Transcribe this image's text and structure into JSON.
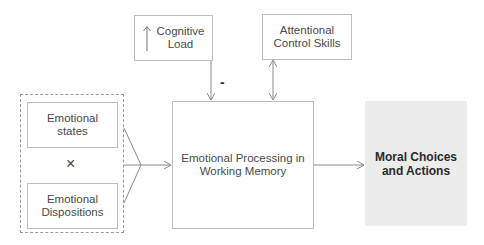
{
  "diagram": {
    "nodes": {
      "cognitive_load": {
        "line1": "Cognitive",
        "line2": "Load",
        "icon": "up-arrow-icon"
      },
      "attentional_control": {
        "line1": "Attentional",
        "line2": "Control Skills"
      },
      "emotional_states": {
        "line1": "Emotional",
        "line2": "states"
      },
      "emotional_dispositions": {
        "line1": "Emotional",
        "line2": "Dispositions"
      },
      "interaction_symbol": "×",
      "emotional_processing": {
        "line1": "Emotional Processing in",
        "line2": "Working Memory"
      },
      "moral_choices": {
        "line1": "Moral Choices",
        "line2": "and Actions"
      }
    },
    "edges": {
      "cognitive_load_label": "-"
    },
    "colors": {
      "box_border": "#bdbdbd",
      "line": "#8a8a8a",
      "moral_fill": "#ececec"
    }
  }
}
